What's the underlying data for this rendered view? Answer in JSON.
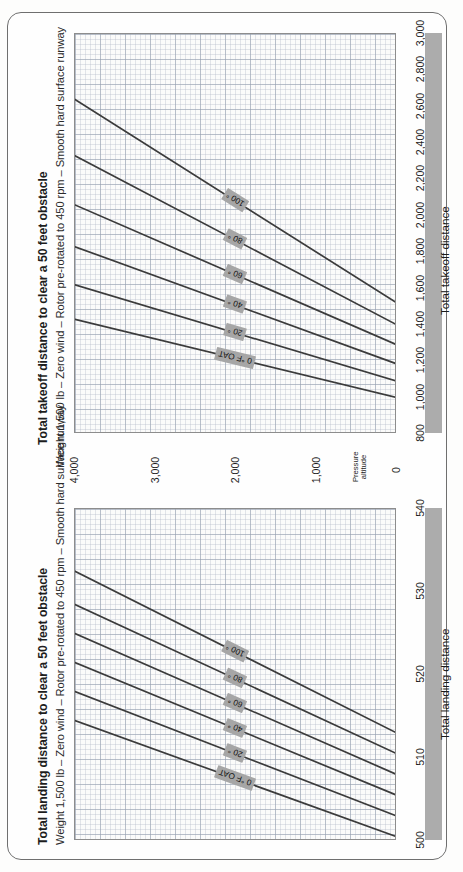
{
  "page": {
    "background": "#fdfdfc",
    "frame_color": "#6f6f6f",
    "accent_gray": "#acacac"
  },
  "shared_axis": {
    "caption_line1": "Pressure",
    "caption_line2": "altitude",
    "ticks": [
      "4,000",
      "3,000",
      "2,000",
      "1,000",
      "0"
    ],
    "values": [
      4000,
      3000,
      2000,
      1000,
      0
    ]
  },
  "takeoff": {
    "title": "Total takeoff distance to clear a 50 feet obstacle",
    "subtitle": "Weight 1,500 lb – Zero wind – Rotor pre-rotated to 450 rpm – Smooth hard surface runway",
    "axis_label": "Total takeoff distance",
    "ticks": [
      "800",
      "1,000",
      "1,200",
      "1,400",
      "1,600",
      "1,800",
      "2,000",
      "2,200",
      "2,400",
      "2,600",
      "2,800",
      "3,000"
    ],
    "curve_labels": [
      "0 °F OAT",
      "20 °",
      "40 °",
      "60 °",
      "80 °",
      "100 °"
    ]
  },
  "landing": {
    "title": "Total landing distance to clear a 50 feet obstacle",
    "subtitle": "Weight 1,500 lb – Zero wind – Rotor pre-rotated to 450 rpm – Smooth hard surface runway",
    "axis_label": "Total landing distance",
    "ticks": [
      "500",
      "510",
      "520",
      "530",
      "540"
    ],
    "curve_labels": [
      "0 °F OAT",
      "20 °",
      "40 °",
      "60 °",
      "80 °",
      "100 °"
    ]
  },
  "chart_data": [
    {
      "type": "line",
      "title": "Total takeoff distance to clear a 50 feet obstacle",
      "subtitle": "Weight 1,500 lb – Zero wind – Rotor pre-rotated to 450 rpm – Smooth hard surface runway",
      "xlabel": "Total takeoff distance",
      "ylabel": "Pressure altitude",
      "orientation": "rotated-90",
      "xlim": [
        800,
        3000
      ],
      "ylim": [
        0,
        4000
      ],
      "xticks": [
        800,
        1000,
        1200,
        1400,
        1600,
        1800,
        2000,
        2200,
        2400,
        2600,
        2800,
        3000
      ],
      "yticks": [
        0,
        1000,
        2000,
        3000,
        4000
      ],
      "grid": true,
      "legend": "inline-curve-labels",
      "series": [
        {
          "name": "0 °F OAT",
          "x": [
            1000,
            1430
          ],
          "y": [
            0,
            4000
          ]
        },
        {
          "name": "20 °",
          "x": [
            1090,
            1620
          ],
          "y": [
            0,
            4000
          ]
        },
        {
          "name": "40 °",
          "x": [
            1185,
            1830
          ],
          "y": [
            0,
            4000
          ]
        },
        {
          "name": "60 °",
          "x": [
            1290,
            2060
          ],
          "y": [
            0,
            4000
          ]
        },
        {
          "name": "80 °",
          "x": [
            1400,
            2330
          ],
          "y": [
            0,
            4000
          ]
        },
        {
          "name": "100 °",
          "x": [
            1520,
            2640
          ],
          "y": [
            0,
            4000
          ]
        }
      ]
    },
    {
      "type": "line",
      "title": "Total landing distance to clear a 50 feet obstacle",
      "subtitle": "Weight 1,500 lb – Zero wind – Rotor pre-rotated to 450 rpm – Smooth hard surface runway",
      "xlabel": "Total landing distance",
      "ylabel": "Pressure altitude",
      "orientation": "rotated-90",
      "xlim": [
        500,
        540
      ],
      "ylim": [
        0,
        4000
      ],
      "xticks": [
        500,
        510,
        520,
        530,
        540
      ],
      "yticks": [
        0,
        1000,
        2000,
        3000,
        4000
      ],
      "grid": true,
      "legend": "inline-curve-labels",
      "series": [
        {
          "name": "0 °F OAT",
          "x": [
            500.5,
            514.5
          ],
          "y": [
            0,
            4000
          ]
        },
        {
          "name": "20 °",
          "x": [
            503.0,
            518.0
          ],
          "y": [
            0,
            4000
          ]
        },
        {
          "name": "40 °",
          "x": [
            505.5,
            521.5
          ],
          "y": [
            0,
            4000
          ]
        },
        {
          "name": "60 °",
          "x": [
            508.0,
            525.0
          ],
          "y": [
            0,
            4000
          ]
        },
        {
          "name": "80 °",
          "x": [
            510.5,
            528.5
          ],
          "y": [
            0,
            4000
          ]
        },
        {
          "name": "100 °",
          "x": [
            513.0,
            532.5
          ],
          "y": [
            0,
            4000
          ]
        }
      ]
    }
  ]
}
